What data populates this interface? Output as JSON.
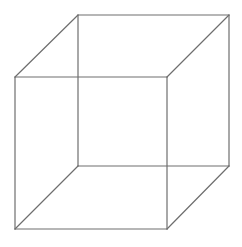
{
  "diagram": {
    "type": "wireframe-cube",
    "background": "#ffffff",
    "stroke_color": "#6e6e6e",
    "stroke_width": 1.2,
    "vertices": {
      "back_top_left": [
        78,
        15
      ],
      "back_top_right": [
        229,
        15
      ],
      "back_bottom_left": [
        78,
        166
      ],
      "back_bottom_right": [
        229,
        166
      ],
      "front_top_left": [
        15,
        77
      ],
      "front_top_right": [
        167,
        77
      ],
      "front_bottom_left": [
        15,
        229
      ],
      "front_bottom_right": [
        167,
        229
      ]
    },
    "edges": [
      [
        "back_top_left",
        "back_top_right"
      ],
      [
        "back_top_right",
        "back_bottom_right"
      ],
      [
        "back_bottom_right",
        "back_bottom_left"
      ],
      [
        "back_bottom_left",
        "back_top_left"
      ],
      [
        "front_top_left",
        "front_top_right"
      ],
      [
        "front_top_right",
        "front_bottom_right"
      ],
      [
        "front_bottom_right",
        "front_bottom_left"
      ],
      [
        "front_bottom_left",
        "front_top_left"
      ],
      [
        "front_top_left",
        "back_top_left"
      ],
      [
        "front_top_right",
        "back_top_right"
      ],
      [
        "front_bottom_left",
        "back_bottom_left"
      ],
      [
        "front_bottom_right",
        "back_bottom_right"
      ]
    ]
  }
}
